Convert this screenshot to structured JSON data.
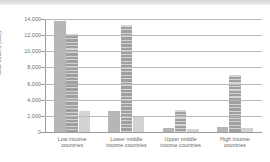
{
  "chart_data": {
    "type": "bar",
    "title": "",
    "xlabel": "",
    "ylabel": "Total deaths (000)",
    "ylim": [
      0,
      14000
    ],
    "yticks": [
      "0",
      "2,000",
      "4,000",
      "6,000",
      "8,000",
      "10,000",
      "12,000",
      "14,000"
    ],
    "ytick_values": [
      0,
      2000,
      4000,
      6000,
      8000,
      10000,
      12000,
      14000
    ],
    "grid": true,
    "legend": "none",
    "categories": [
      "Low income countries",
      "Lower middle income countries",
      "Upper middle income countries",
      "High income countries"
    ],
    "category_lines": [
      [
        "Low income",
        "countries"
      ],
      [
        "Lower middle",
        "income countries"
      ],
      [
        "Upper middle",
        "income countries"
      ],
      [
        "High income",
        "countries"
      ]
    ],
    "series": [
      {
        "name": "Series 1",
        "color": "#b6b6b6",
        "values": [
          13700,
          2550,
          500,
          600
        ]
      },
      {
        "name": "Series 2",
        "color": "#a0a0a0",
        "values": [
          12200,
          13200,
          2750,
          7100
        ]
      },
      {
        "name": "Series 3",
        "color": "#d3d3d3",
        "values": [
          2550,
          1950,
          400,
          550
        ]
      }
    ]
  },
  "colors": {
    "series1": "#b6b6b6",
    "series2": "#a0a0a0",
    "series3": "#d3d3d3",
    "axis": "#9a9a9a",
    "grid": "#b9b9b9",
    "text": "#6b6b6b",
    "background": "#ffffff"
  }
}
